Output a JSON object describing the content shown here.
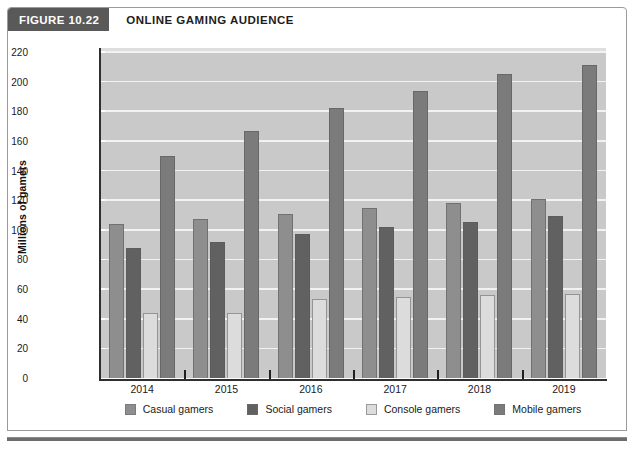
{
  "figure": {
    "tag": "FIGURE 10.22",
    "title": "ONLINE GAMING AUDIENCE"
  },
  "legend": {
    "position": "bottom-center",
    "items": [
      {
        "label": "Casual gamers",
        "color": "#8e8e8e"
      },
      {
        "label": "Social gamers",
        "color": "#616161"
      },
      {
        "label": "Console gamers",
        "color": "#dcdcdc"
      },
      {
        "label": "Mobile gamers",
        "color": "#7b7b7b"
      }
    ]
  },
  "axes": {
    "y_title": "Millions of gamers",
    "y_ticks": [
      "0",
      "20",
      "40",
      "60",
      "80",
      "100",
      "120",
      "140",
      "160",
      "180",
      "200",
      "220"
    ],
    "x_ticks": [
      "2014",
      "2015",
      "2016",
      "2017",
      "2018",
      "2019"
    ]
  },
  "chart_data": {
    "type": "bar",
    "title": "ONLINE GAMING AUDIENCE",
    "xlabel": "",
    "ylabel": "Millions of gamers",
    "ylim": [
      0,
      220
    ],
    "ytick_step": 20,
    "grid": true,
    "legend_position": "bottom",
    "categories": [
      "2014",
      "2015",
      "2016",
      "2017",
      "2018",
      "2019"
    ],
    "series": [
      {
        "name": "Casual gamers",
        "color": "#8e8e8e",
        "values": [
          104,
          107,
          111,
          115,
          118,
          121
        ]
      },
      {
        "name": "Social gamers",
        "color": "#616161",
        "values": [
          88,
          92,
          97,
          102,
          105,
          109
        ]
      },
      {
        "name": "Console gamers",
        "color": "#dcdcdc",
        "values": [
          44,
          44,
          53,
          55,
          56,
          57
        ]
      },
      {
        "name": "Mobile gamers",
        "color": "#7b7b7b",
        "values": [
          150,
          167,
          182,
          194,
          205,
          211
        ]
      }
    ]
  }
}
